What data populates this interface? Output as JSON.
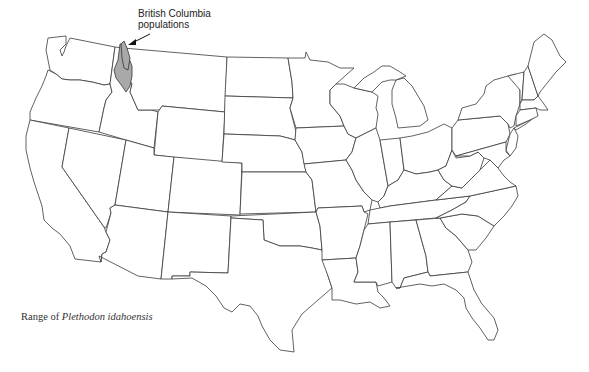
{
  "map": {
    "type": "range map",
    "region": "Contiguous United States",
    "species": "Plethodon idahoensis",
    "range_fill_color": "#a9a9a9",
    "outline_color": "#3a3a3a",
    "background_color": "#ffffff"
  },
  "annotation": {
    "line1": "British Columbia",
    "line2": "populations"
  },
  "caption": {
    "prefix": "Range of ",
    "species_name": "Plethodon idahoensis"
  }
}
